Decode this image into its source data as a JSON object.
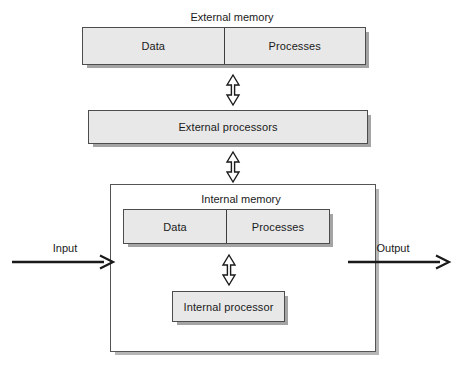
{
  "diagram": {
    "colors": {
      "box_fill": "#e8e8e8",
      "box_border": "#4d4d4d",
      "container_border": "#555555",
      "shadow": "#6e6e6e",
      "text": "#1a1a1a",
      "background": "#ffffff"
    },
    "external_memory": {
      "caption": "External memory",
      "segments": [
        {
          "label": "Data"
        },
        {
          "label": "Processes"
        }
      ]
    },
    "external_processors": {
      "label": "External processors"
    },
    "internal_unit": {
      "memory_caption": "Internal memory",
      "memory_segments": [
        {
          "label": "Data"
        },
        {
          "label": "Processes"
        }
      ],
      "processor_label": "Internal processor"
    },
    "flows": {
      "input_label": "Input",
      "output_label": "Output"
    },
    "connectors": [
      {
        "name": "external-memory-to-external-processors",
        "kind": "double-headed-vertical"
      },
      {
        "name": "external-processors-to-internal-unit",
        "kind": "double-headed-vertical"
      },
      {
        "name": "internal-memory-to-internal-processor",
        "kind": "double-headed-vertical"
      }
    ]
  }
}
